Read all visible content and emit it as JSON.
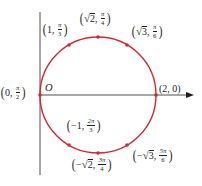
{
  "diagram": {
    "colors": {
      "curve": "#d7282f",
      "axis": "#231f20",
      "text": "#231f20"
    },
    "geometry": {
      "center_x": 98,
      "center_y": 95,
      "radius": 58,
      "polar_axis": {
        "x1": 40,
        "y1": 95,
        "x2": 194,
        "y2": 95
      },
      "vertical_line": {
        "x": 40,
        "y1": 12,
        "y2": 175
      }
    },
    "origin_label": "O",
    "points": [
      {
        "id": "p-0-pi2",
        "r": "0",
        "theta": "π/2",
        "cart_x": 40,
        "cart_y": 95
      },
      {
        "id": "p-1-pi3",
        "r": "1",
        "theta": "π/3",
        "cart_x": 69,
        "cart_y": 45
      },
      {
        "id": "p-sqrt2-pi4",
        "r": "√2",
        "theta": "π/4",
        "cart_x": 98,
        "cart_y": 37
      },
      {
        "id": "p-sqrt3-pi6",
        "r": "√3",
        "theta": "π/6",
        "cart_x": 127,
        "cart_y": 45
      },
      {
        "id": "p-2-0",
        "r": "2",
        "theta": "0",
        "cart_x": 156,
        "cart_y": 95
      },
      {
        "id": "p-neg1-2pi3",
        "r": "−1",
        "theta": "2π/3",
        "cart_x": 69,
        "cart_y": 145
      },
      {
        "id": "p-negsqrt2-3pi4",
        "r": "−√2",
        "theta": "3π/4",
        "cart_x": 98,
        "cart_y": 153
      },
      {
        "id": "p-negsqrt3-5pi6",
        "r": "−√3",
        "theta": "5π/6",
        "cart_x": 127,
        "cart_y": 145
      }
    ],
    "labels": {
      "p_0_pi2": {
        "open": "(",
        "r": "0",
        "comma": ",",
        "num": "π",
        "den": "2",
        "close": ")"
      },
      "p_1_pi3": {
        "open": "(",
        "r": "1",
        "comma": ",",
        "num": "π",
        "den": "3",
        "close": ")"
      },
      "p_sqrt2_pi4": {
        "open": "(",
        "rad": "√",
        "r": "2",
        "comma": ",",
        "num": "π",
        "den": "4",
        "close": ")"
      },
      "p_sqrt3_pi6": {
        "open": "(",
        "rad": "√",
        "r": "3",
        "comma": ",",
        "num": "π",
        "den": "6",
        "close": ")"
      },
      "p_2_0": {
        "text": "(2, 0)"
      },
      "p_neg1_2pi3": {
        "open": "(",
        "r": "−1",
        "comma": ",",
        "num": "2π",
        "den": "3",
        "close": ")"
      },
      "p_negsqrt2_3pi4": {
        "open": "(",
        "sign": "−",
        "rad": "√",
        "r": "2",
        "comma": ",",
        "num": "3π",
        "den": "4",
        "close": ")"
      },
      "p_negsqrt3_5pi6": {
        "open": "(",
        "sign": "−",
        "rad": "√",
        "r": "3",
        "comma": ",",
        "num": "5π",
        "den": "6",
        "close": ")"
      }
    }
  }
}
